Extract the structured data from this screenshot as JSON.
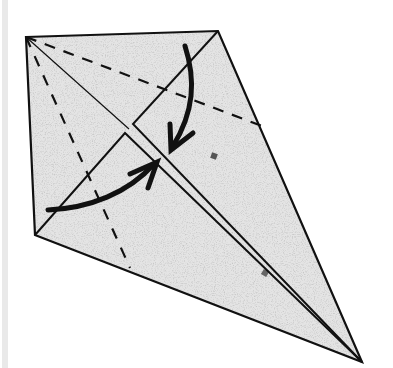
{
  "diagram": {
    "paper_fill": "#e4e4e4",
    "speck_color": "#9a9a9a",
    "line_color": "#111111",
    "background": "#ffffff",
    "left_strip_color": "#e9e9e9",
    "outline": {
      "vertices": [
        [
          26,
          37
        ],
        [
          218,
          31
        ],
        [
          362,
          362
        ],
        [
          35,
          235
        ]
      ],
      "labels": [
        "top-left corner",
        "top corner",
        "bottom tip",
        "left corner"
      ]
    },
    "center_diagonal": {
      "from": [
        26,
        37
      ],
      "to": [
        362,
        362
      ],
      "style": "thin line, doubled from flap meeting point to tip"
    },
    "upper_flap": {
      "edge_from": [
        218,
        31
      ],
      "corner": [
        133,
        124
      ],
      "meets_diagonal": [
        362,
        362
      ]
    },
    "lower_flap": {
      "edge_from": [
        35,
        235
      ],
      "corner": [
        125,
        133
      ],
      "meets_diagonal": [
        362,
        362
      ]
    },
    "valley_folds": [
      {
        "name": "upper valley fold",
        "from": [
          26,
          37
        ],
        "to": [
          262,
          126
        ],
        "style": "dashed"
      },
      {
        "name": "lower valley fold",
        "from": [
          26,
          37
        ],
        "to": [
          130,
          268
        ],
        "style": "dashed"
      }
    ],
    "arrows": [
      {
        "name": "fold-down arrow",
        "from": [
          185,
          46
        ],
        "to": [
          171,
          150
        ],
        "direction": "down toward diagonal"
      },
      {
        "name": "fold-up arrow",
        "from": [
          48,
          210
        ],
        "to": [
          157,
          162
        ],
        "direction": "up-right toward diagonal"
      }
    ]
  }
}
